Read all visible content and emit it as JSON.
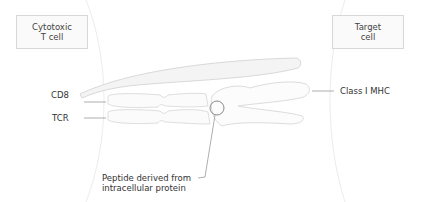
{
  "boxes": {
    "left": {
      "line1": "Cytotoxic",
      "line2": "T cell"
    },
    "right": {
      "line1": "Target",
      "line2": "cell"
    }
  },
  "labels": {
    "cd8": "CD8",
    "tcr": "TCR",
    "mhc": "Class I MHC",
    "peptide_line1": "Peptide derived from",
    "peptide_line2": "intracellular protein"
  },
  "colors": {
    "outline": "#d9d9d9",
    "leader": "#8a8a8a",
    "text": "#333333"
  }
}
